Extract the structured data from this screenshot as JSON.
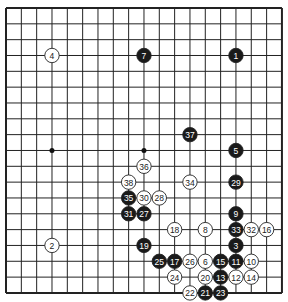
{
  "board": {
    "size": 19,
    "origin_x": 6,
    "origin_y": 8,
    "step_x": 15.33,
    "step_y": 15.83,
    "line_color": "#222222",
    "hoshi_visible": [
      [
        4,
        10
      ],
      [
        10,
        10
      ]
    ]
  },
  "colors": {
    "black": "#1a1a1a",
    "white": "#ffffff",
    "black_text": "#ffffff",
    "white_text": "#222222"
  },
  "stones": [
    {
      "n": "1",
      "color": "black",
      "col": 16,
      "row": 4
    },
    {
      "n": "2",
      "color": "white",
      "col": 4,
      "row": 16
    },
    {
      "n": "3",
      "color": "black",
      "col": 16,
      "row": 16
    },
    {
      "n": "4",
      "color": "white",
      "col": 4,
      "row": 4
    },
    {
      "n": "5",
      "color": "black",
      "col": 16,
      "row": 10
    },
    {
      "n": "6",
      "color": "white",
      "col": 14,
      "row": 17
    },
    {
      "n": "7",
      "color": "black",
      "col": 10,
      "row": 4
    },
    {
      "n": "8",
      "color": "white",
      "col": 14,
      "row": 15
    },
    {
      "n": "9",
      "color": "black",
      "col": 16,
      "row": 14
    },
    {
      "n": "10",
      "color": "white",
      "col": 17,
      "row": 17
    },
    {
      "n": "11",
      "color": "black",
      "col": 16,
      "row": 17
    },
    {
      "n": "12",
      "color": "white",
      "col": 16,
      "row": 18
    },
    {
      "n": "13",
      "color": "black",
      "col": 15,
      "row": 18
    },
    {
      "n": "14",
      "color": "white",
      "col": 17,
      "row": 18
    },
    {
      "n": "15",
      "color": "black",
      "col": 15,
      "row": 17
    },
    {
      "n": "16",
      "color": "white",
      "col": 18,
      "row": 15
    },
    {
      "n": "17",
      "color": "black",
      "col": 12,
      "row": 17
    },
    {
      "n": "18",
      "color": "white",
      "col": 12,
      "row": 15
    },
    {
      "n": "19",
      "color": "black",
      "col": 10,
      "row": 16
    },
    {
      "n": "20",
      "color": "white",
      "col": 14,
      "row": 18
    },
    {
      "n": "21",
      "color": "black",
      "col": 14,
      "row": 19
    },
    {
      "n": "22",
      "color": "white",
      "col": 13,
      "row": 19
    },
    {
      "n": "23",
      "color": "black",
      "col": 15,
      "row": 19
    },
    {
      "n": "24",
      "color": "white",
      "col": 12,
      "row": 18
    },
    {
      "n": "25",
      "color": "black",
      "col": 11,
      "row": 17
    },
    {
      "n": "26",
      "color": "white",
      "col": 13,
      "row": 17
    },
    {
      "n": "27",
      "color": "black",
      "col": 10,
      "row": 14
    },
    {
      "n": "28",
      "color": "white",
      "col": 11,
      "row": 13
    },
    {
      "n": "29",
      "color": "black",
      "col": 16,
      "row": 12
    },
    {
      "n": "30",
      "color": "white",
      "col": 10,
      "row": 13
    },
    {
      "n": "31",
      "color": "black",
      "col": 9,
      "row": 14
    },
    {
      "n": "32",
      "color": "white",
      "col": 17,
      "row": 15
    },
    {
      "n": "33",
      "color": "black",
      "col": 16,
      "row": 15
    },
    {
      "n": "34",
      "color": "white",
      "col": 13,
      "row": 12
    },
    {
      "n": "35",
      "color": "black",
      "col": 9,
      "row": 13
    },
    {
      "n": "36",
      "color": "white",
      "col": 10,
      "row": 11
    },
    {
      "n": "37",
      "color": "black",
      "col": 13,
      "row": 9
    },
    {
      "n": "38",
      "color": "white",
      "col": 9,
      "row": 12
    }
  ]
}
